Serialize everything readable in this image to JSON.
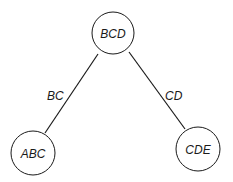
{
  "diagram": {
    "type": "tree",
    "nodes": [
      {
        "id": "BCD",
        "label": "BCD",
        "cx": 113,
        "cy": 33,
        "r": 21
      },
      {
        "id": "ABC",
        "label": "ABC",
        "cx": 33,
        "cy": 153,
        "r": 22
      },
      {
        "id": "CDE",
        "label": "CDE",
        "cx": 198,
        "cy": 149,
        "r": 22
      }
    ],
    "edges": [
      {
        "from": "BCD",
        "to": "ABC",
        "label": "BC"
      },
      {
        "from": "BCD",
        "to": "CDE",
        "label": "CD"
      }
    ],
    "colors": {
      "stroke": "#1a1a1a",
      "background": "#ffffff"
    }
  }
}
